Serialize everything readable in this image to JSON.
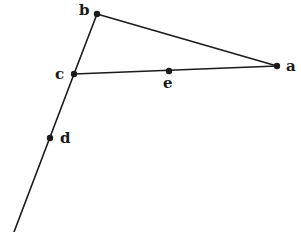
{
  "diagram": {
    "type": "geometric-figure",
    "points": [
      {
        "id": "a",
        "label": "a",
        "x": 277,
        "y": 66,
        "label_x": 286,
        "label_y": 71
      },
      {
        "id": "b",
        "label": "b",
        "x": 97,
        "y": 14,
        "label_x": 79,
        "label_y": 15
      },
      {
        "id": "c",
        "label": "c",
        "x": 74,
        "y": 74,
        "label_x": 55,
        "label_y": 79
      },
      {
        "id": "d",
        "label": "d",
        "x": 50,
        "y": 138,
        "label_x": 60,
        "label_y": 143
      },
      {
        "id": "e",
        "label": "e",
        "x": 169,
        "y": 71,
        "label_x": 163,
        "label_y": 88
      }
    ],
    "segments": [
      {
        "id": "b-a",
        "from": "b",
        "to": "a"
      },
      {
        "id": "b-c",
        "from": "b",
        "to": "c"
      },
      {
        "id": "c-a",
        "from": "c",
        "to": "a"
      },
      {
        "id": "c-ray",
        "from": "c",
        "to_xy": [
          14,
          232
        ]
      }
    ],
    "colors": {
      "ink": "#1a1a1a",
      "background": "#ffffff"
    }
  }
}
